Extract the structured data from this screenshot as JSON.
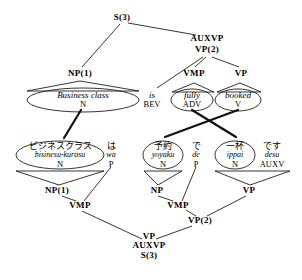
{
  "figure": {
    "type": "syntax-tree-alignment-diagram",
    "source_language": "English",
    "target_language": "Japanese",
    "line_color": "#000000",
    "background_color": "#ffffff"
  },
  "english_tree": {
    "root": {
      "label": "S(3)",
      "x": 122,
      "y": 18
    },
    "internal_nodes": [
      {
        "label": "AUXVP",
        "x": 207,
        "y": 39
      },
      {
        "label": "VP(2)",
        "x": 207,
        "y": 50
      },
      {
        "label": "NP(1)",
        "x": 80,
        "y": 74
      },
      {
        "label": "VMP",
        "x": 194,
        "y": 74
      },
      {
        "label": "VP",
        "x": 241,
        "y": 74
      }
    ],
    "leaves": [
      {
        "word": "Business class",
        "pos": "N",
        "x": 83,
        "y": 97,
        "ellipse": true,
        "hat": true
      },
      {
        "word": "is",
        "pos": "BEV",
        "x": 152,
        "y": 97,
        "ellipse": false,
        "hat": false
      },
      {
        "word": "fully",
        "pos": "ADV",
        "x": 192,
        "y": 97,
        "ellipse": true,
        "hat": true
      },
      {
        "word": "booked",
        "pos": "V",
        "x": 237,
        "y": 97,
        "ellipse": true,
        "hat": true
      }
    ]
  },
  "japanese_tree": {
    "root": {
      "labels": [
        "VP",
        "AUXVP",
        "S(3)"
      ],
      "x": 149,
      "y": 246
    },
    "internal_nodes": [
      {
        "label": "NP(1)",
        "x": 57,
        "y": 191
      },
      {
        "label": "VMP",
        "x": 80,
        "y": 206
      },
      {
        "label": "NP",
        "x": 157,
        "y": 191
      },
      {
        "label": "VMP",
        "x": 178,
        "y": 206
      },
      {
        "label": "VP",
        "x": 249,
        "y": 191
      },
      {
        "label": "VP(2)",
        "x": 200,
        "y": 221
      }
    ],
    "leaves": [
      {
        "word": "ビジネスクラス",
        "romaji": "bisinesu-kurasu",
        "pos": "N",
        "x": 60,
        "y": 154,
        "ellipse": true,
        "hat": true
      },
      {
        "word": "は",
        "romaji": "wa",
        "pos": "P",
        "x": 110,
        "y": 154,
        "ellipse": false,
        "hat": false
      },
      {
        "word": "予約",
        "romaji": "yoyaku",
        "pos": "N",
        "x": 163,
        "y": 154,
        "ellipse": true,
        "hat": true
      },
      {
        "word": "で",
        "romaji": "de",
        "pos": "P",
        "x": 196,
        "y": 154,
        "ellipse": false,
        "hat": false
      },
      {
        "word": "一杯",
        "romaji": "ippai",
        "pos": "N",
        "x": 235,
        "y": 154,
        "ellipse": true,
        "hat": true
      },
      {
        "word": "です",
        "romaji": "desu",
        "pos": "AUXV",
        "x": 272,
        "y": 154,
        "ellipse": false,
        "hat": false
      }
    ]
  },
  "alignment_links": [
    {
      "from": "Business class",
      "to": "ビジネスクラス",
      "x1": 81,
      "y1": 110,
      "x2": 64,
      "y2": 138
    },
    {
      "from": "fully",
      "to": "一杯",
      "x1": 193,
      "y1": 110,
      "x2": 236,
      "y2": 138
    },
    {
      "from": "booked",
      "to": "予約",
      "x1": 238,
      "y1": 110,
      "x2": 164,
      "y2": 138
    }
  ]
}
